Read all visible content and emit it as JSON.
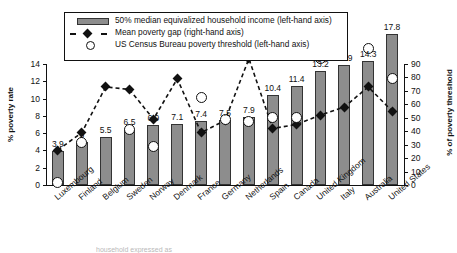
{
  "legend": {
    "items": [
      {
        "key": "bar-swatch",
        "label": "50% median equivalized household income (left-hand axis)"
      },
      {
        "key": "diamond-line",
        "label": "Mean poverty gap (right-hand axis)"
      },
      {
        "key": "open-circle",
        "label": "US Census Bureau poverty threshold (left-hand axis)"
      }
    ]
  },
  "caption": "household expressed as",
  "colors": {
    "bar_fill": "#8d8d8d",
    "bar_stroke": "#333333",
    "marker": "#111111",
    "axis": "#111111",
    "background": "#ffffff"
  },
  "chart_data": {
    "type": "bar",
    "title": "",
    "xlabel": "",
    "ylabel": "% poverty rate",
    "ylabel_right": "% of poverty threshold",
    "ylim": [
      0,
      14
    ],
    "ylim_right": [
      0,
      90
    ],
    "yticks": [
      0,
      2,
      4,
      6,
      8,
      10,
      12,
      14
    ],
    "yticks_right": [
      0,
      10,
      20,
      30,
      40,
      50,
      60,
      70,
      80,
      90
    ],
    "grid": false,
    "legend_position": "top-left",
    "categories": [
      "Luxembourg",
      "Finland",
      "Belgium",
      "Sweden",
      "Norway",
      "Denmark",
      "France",
      "Germany",
      "Netherlands",
      "Spain",
      "Canada",
      "United Kingdom",
      "Italy",
      "Australia",
      "United States"
    ],
    "series": [
      {
        "name": "50% median equivalized household income (left-hand axis)",
        "type": "bar",
        "axis": "left",
        "values": [
          3.9,
          5,
          5.5,
          6.5,
          6.9,
          7.1,
          7.4,
          7.5,
          7.9,
          10.4,
          11.4,
          13.2,
          13.9,
          14.3,
          17.8
        ],
        "data_labels": [
          "3.9",
          "5",
          "5.5",
          "6.5",
          "6.9",
          "7.1",
          "7.4",
          "7.5",
          "7.9",
          "10.4",
          "11.4",
          "13.2",
          "13.9",
          "14.3",
          "17.8"
        ]
      },
      {
        "name": "Mean poverty gap (right-hand axis)",
        "type": "line",
        "axis": "right",
        "values": [
          26,
          39,
          73,
          71,
          49,
          79,
          39,
          48,
          94,
          42,
          45,
          52,
          58,
          73,
          55
        ]
      },
      {
        "name": "US Census Bureau poverty threshold (left-hand axis)",
        "type": "scatter",
        "axis": "left",
        "values": [
          0.3,
          4.9,
          null,
          6.4,
          4.5,
          null,
          10.1,
          7.6,
          7.4,
          7.8,
          7.8,
          14.6,
          null,
          15.8,
          12.3
        ]
      }
    ]
  }
}
